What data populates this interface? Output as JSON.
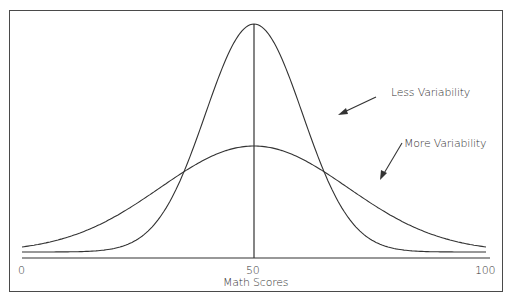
{
  "chart_data": {
    "type": "line",
    "title": "",
    "xlabel": "Math Scores",
    "ylabel": "",
    "xlim": [
      0,
      100
    ],
    "x_ticks": [
      "0",
      "50",
      "100"
    ],
    "grid": false,
    "legend": "none",
    "series": [
      {
        "name": "Less Variability",
        "distribution": "normal",
        "mean": 50,
        "relative_sd": 11,
        "relative_peak": 1.0
      },
      {
        "name": "More Variability",
        "distribution": "normal",
        "mean": 50,
        "relative_sd": 22,
        "relative_peak": 0.48
      }
    ],
    "annotations": [
      {
        "text": "Less Variability",
        "points_to": "Less Variability"
      },
      {
        "text": "More Variability",
        "points_to": "More Variability"
      }
    ],
    "reference_line": {
      "x": 50,
      "label": "mean"
    }
  },
  "axis": {
    "tick_0": "0",
    "tick_50": "50",
    "tick_100": "100",
    "label": "Math Scores"
  },
  "annotations": {
    "less": "Less Variability",
    "more": "More Variability"
  }
}
